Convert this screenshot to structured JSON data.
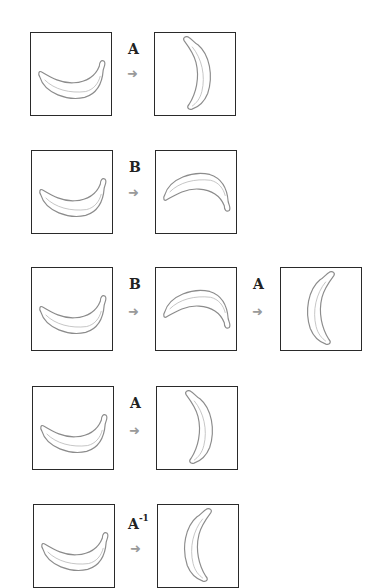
{
  "figure": {
    "rows": [
      {
        "id": "row-1",
        "steps": [
          {
            "image": "banana-smile-original"
          },
          {
            "transform": "A",
            "superscript": "",
            "image": "banana-rotated-right"
          }
        ]
      },
      {
        "id": "row-2",
        "steps": [
          {
            "image": "banana-smile-original"
          },
          {
            "transform": "B",
            "superscript": "",
            "image": "banana-flipped-arch"
          }
        ]
      },
      {
        "id": "row-3",
        "steps": [
          {
            "image": "banana-smile-original"
          },
          {
            "transform": "B",
            "superscript": "",
            "image": "banana-flipped-arch"
          },
          {
            "transform": "A",
            "superscript": "",
            "image": "banana-rotated-left"
          }
        ]
      },
      {
        "id": "row-4",
        "steps": [
          {
            "image": "banana-smile-original"
          },
          {
            "transform": "A",
            "superscript": "",
            "image": "banana-rotated-right"
          }
        ]
      },
      {
        "id": "row-5",
        "steps": [
          {
            "image": "banana-smile-original"
          },
          {
            "transform": "A",
            "superscript": "-1",
            "image": "banana-rotated-left"
          }
        ]
      }
    ],
    "arrow_glyph": "➜",
    "colors": {
      "border": "#2a2a2a",
      "arrow": "#9a9a9a",
      "banana_stroke": "#8c8c8c",
      "label": "#222222"
    }
  }
}
